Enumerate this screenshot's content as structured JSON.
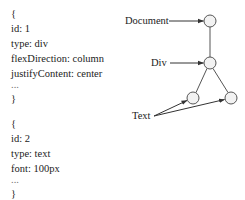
{
  "code_blocks": [
    {
      "open": "{",
      "lines": [
        "id: 1",
        "type: div",
        "flexDirection: column",
        "justifyContent: center"
      ],
      "ellipsis": "...",
      "close": "}"
    },
    {
      "open": "{",
      "lines": [
        "id: 2",
        "type: text",
        "font: 100px"
      ],
      "ellipsis": "...",
      "close": "}"
    }
  ],
  "tree": {
    "labels": {
      "document": "Document",
      "div": "Div",
      "text": "Text"
    },
    "nodes": [
      {
        "id": "document",
        "cx": 210,
        "cy": 21
      },
      {
        "id": "div",
        "cx": 210,
        "cy": 63
      },
      {
        "id": "text-left",
        "cx": 193,
        "cy": 98
      },
      {
        "id": "text-right",
        "cx": 231,
        "cy": 98
      }
    ],
    "node_fill": "#f2f2f2",
    "stroke": "#444444"
  }
}
